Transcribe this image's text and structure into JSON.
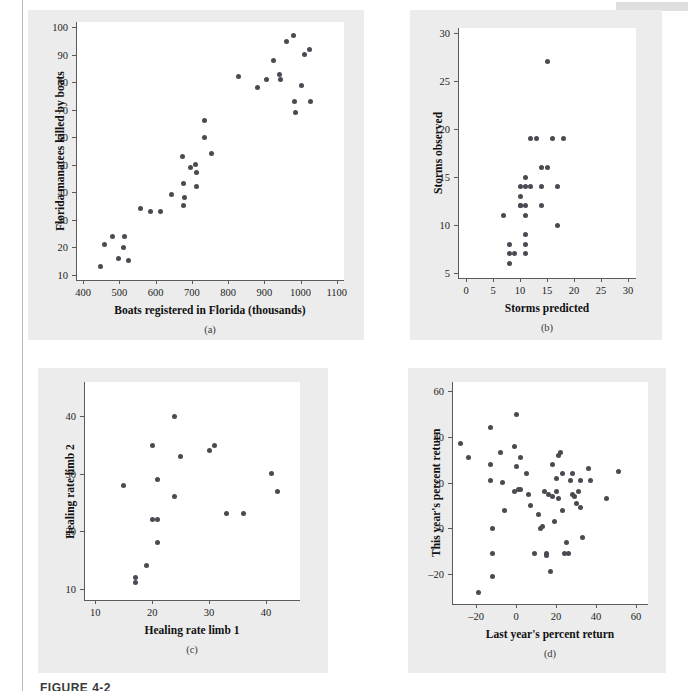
{
  "figure": {
    "caption": "FIGURE 4-2",
    "dot_color": "#4a4a52",
    "panel_bg": "#ececec",
    "plot_bg": "#ffffff",
    "axis_color": "#5b5b5b"
  },
  "chart_data": [
    {
      "id": "a",
      "type": "scatter",
      "letter": "(a)",
      "title": "",
      "xlabel": "Boats registered in Florida (thousands)",
      "ylabel": "Florida manatees killed by boats",
      "xlim": [
        380,
        1120
      ],
      "ylim": [
        8,
        102
      ],
      "xticks": [
        400,
        500,
        600,
        700,
        800,
        900,
        1000,
        1100
      ],
      "yticks": [
        10,
        20,
        30,
        40,
        50,
        60,
        70,
        80,
        90,
        100
      ],
      "grid": false,
      "legend": "none",
      "points": [
        [
          447,
          13
        ],
        [
          460,
          21
        ],
        [
          481,
          24
        ],
        [
          498,
          16
        ],
        [
          513,
          24
        ],
        [
          512,
          20
        ],
        [
          526,
          15
        ],
        [
          559,
          34
        ],
        [
          585,
          33
        ],
        [
          614,
          33
        ],
        [
          645,
          39
        ],
        [
          675,
          53
        ],
        [
          678,
          43
        ],
        [
          679,
          38
        ],
        [
          678,
          35
        ],
        [
          696,
          49
        ],
        [
          711,
          50
        ],
        [
          712,
          42
        ],
        [
          714,
          47
        ],
        [
          735,
          60
        ],
        [
          755,
          54
        ],
        [
          735,
          66
        ],
        [
          830,
          82
        ],
        [
          880,
          78
        ],
        [
          905,
          81
        ],
        [
          925,
          88
        ],
        [
          943,
          83
        ],
        [
          944,
          81
        ],
        [
          961,
          95
        ],
        [
          980,
          97
        ],
        [
          982,
          73
        ],
        [
          985,
          69
        ],
        [
          1003,
          79
        ],
        [
          1010,
          90
        ],
        [
          1025,
          92
        ],
        [
          1028,
          73
        ]
      ]
    },
    {
      "id": "b",
      "type": "scatter",
      "letter": "(b)",
      "title": "",
      "xlabel": "Storms predicted",
      "ylabel": "Storms observed",
      "xlim": [
        -1.5,
        31.5
      ],
      "ylim": [
        4.5,
        30.5
      ],
      "xticks": [
        0,
        5,
        10,
        15,
        20,
        25,
        30
      ],
      "yticks": [
        5,
        10,
        15,
        20,
        25,
        30
      ],
      "grid": false,
      "legend": "none",
      "points": [
        [
          7,
          11
        ],
        [
          8,
          8
        ],
        [
          8,
          7
        ],
        [
          8,
          6
        ],
        [
          9,
          7
        ],
        [
          10,
          14
        ],
        [
          10,
          13
        ],
        [
          10,
          12
        ],
        [
          10,
          12
        ],
        [
          11,
          15
        ],
        [
          11,
          14
        ],
        [
          11,
          12
        ],
        [
          11,
          11
        ],
        [
          11,
          9
        ],
        [
          11,
          8
        ],
        [
          11,
          7
        ],
        [
          12,
          19
        ],
        [
          12,
          14
        ],
        [
          13,
          19
        ],
        [
          14,
          16
        ],
        [
          14,
          14
        ],
        [
          14,
          12
        ],
        [
          15,
          27
        ],
        [
          15,
          16
        ],
        [
          16,
          19
        ],
        [
          17,
          14
        ],
        [
          17,
          10
        ],
        [
          18,
          19
        ]
      ]
    },
    {
      "id": "c",
      "type": "scatter",
      "letter": "(c)",
      "title": "",
      "xlabel": "Healing rate limb 1",
      "ylabel": "Healing rate limb 2",
      "xlim": [
        8,
        46
      ],
      "ylim": [
        8,
        46
      ],
      "xticks": [
        10,
        20,
        30,
        40
      ],
      "yticks": [
        10,
        20,
        30,
        40
      ],
      "grid": false,
      "legend": "none",
      "points": [
        [
          15,
          28
        ],
        [
          17,
          12
        ],
        [
          17,
          11
        ],
        [
          19,
          14
        ],
        [
          20,
          35
        ],
        [
          20,
          22
        ],
        [
          21,
          22
        ],
        [
          21,
          18
        ],
        [
          21,
          29
        ],
        [
          24,
          40
        ],
        [
          24,
          26
        ],
        [
          25,
          33
        ],
        [
          30,
          34
        ],
        [
          31,
          35
        ],
        [
          33,
          23
        ],
        [
          36,
          23
        ],
        [
          41,
          30
        ],
        [
          42,
          27
        ]
      ]
    },
    {
      "id": "d",
      "type": "scatter",
      "letter": "(d)",
      "title": "",
      "xlabel": "Last year's percent return",
      "ylabel": "This year's percent return",
      "xlim": [
        -32,
        66
      ],
      "ylim": [
        -33,
        64
      ],
      "xticks": [
        -20,
        0,
        20,
        40,
        60
      ],
      "yticks": [
        -20,
        0,
        20,
        40,
        60
      ],
      "grid": false,
      "legend": "none",
      "points": [
        [
          -28,
          37
        ],
        [
          -24,
          31
        ],
        [
          -19,
          -28
        ],
        [
          -13,
          44
        ],
        [
          -13,
          28
        ],
        [
          -13,
          21
        ],
        [
          -12,
          0
        ],
        [
          -12,
          -11
        ],
        [
          -12,
          -21
        ],
        [
          -8,
          33
        ],
        [
          -7,
          20
        ],
        [
          -6,
          8
        ],
        [
          -1,
          36
        ],
        [
          -1,
          16
        ],
        [
          0,
          50
        ],
        [
          0,
          27
        ],
        [
          1,
          17
        ],
        [
          2,
          31
        ],
        [
          2,
          17
        ],
        [
          5,
          24
        ],
        [
          6,
          15
        ],
        [
          7,
          10
        ],
        [
          9,
          -11
        ],
        [
          11,
          6
        ],
        [
          12,
          0
        ],
        [
          13,
          1
        ],
        [
          14,
          16
        ],
        [
          15,
          -11
        ],
        [
          15,
          -12
        ],
        [
          16,
          15
        ],
        [
          17,
          -19
        ],
        [
          18,
          28
        ],
        [
          18,
          14
        ],
        [
          19,
          3
        ],
        [
          20,
          22
        ],
        [
          20,
          16
        ],
        [
          21,
          13
        ],
        [
          21,
          32
        ],
        [
          22,
          33
        ],
        [
          23,
          24
        ],
        [
          23,
          8
        ],
        [
          24,
          -11
        ],
        [
          25,
          -6
        ],
        [
          26,
          -11
        ],
        [
          27,
          21
        ],
        [
          28,
          24
        ],
        [
          28,
          15
        ],
        [
          29,
          14
        ],
        [
          30,
          11
        ],
        [
          31,
          16
        ],
        [
          32,
          21
        ],
        [
          32,
          9
        ],
        [
          33,
          -4
        ],
        [
          36,
          26
        ],
        [
          37,
          21
        ],
        [
          45,
          13
        ],
        [
          51,
          25
        ]
      ]
    }
  ]
}
